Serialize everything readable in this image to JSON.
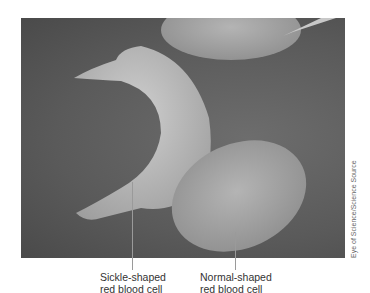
{
  "figure": {
    "labels": {
      "sickle_line1": "Sickle-shaped",
      "sickle_line2": "red blood cell",
      "normal_line1": "Normal-shaped",
      "normal_line2": "red blood cell"
    },
    "credit": "Eye of Science/Science Source",
    "colors": {
      "background": "#5e5e5e",
      "cell": "#b5b5b5",
      "label_text": "#333333",
      "leader_line": "#9a9a9a"
    }
  }
}
